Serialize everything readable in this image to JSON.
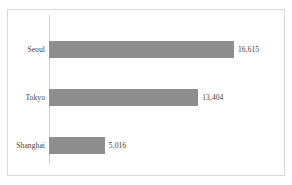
{
  "chart_data": {
    "type": "bar",
    "orientation": "horizontal",
    "title": "",
    "xlabel": "",
    "ylabel": "",
    "categories": [
      "Seoul",
      "Tokyo",
      "Shanghai"
    ],
    "values": [
      16615,
      13404,
      5016
    ],
    "value_labels": [
      "16,615",
      "13,404",
      "5,016"
    ],
    "xlim": [
      0,
      16615
    ],
    "grid": false,
    "legend": false,
    "bar_color": "#8e8e8e",
    "text_color": "#3d3d3d",
    "frame_color": "#d9d9d9",
    "axis_color": "#d0d0d0"
  }
}
